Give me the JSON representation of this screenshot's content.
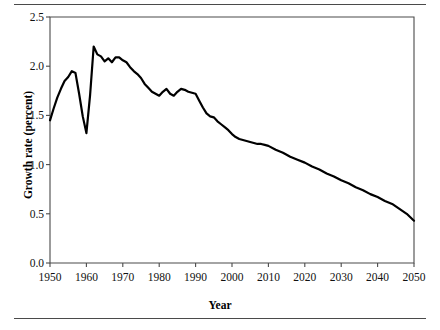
{
  "chart_data": {
    "type": "line",
    "title": "",
    "xlabel": "Year",
    "ylabel": "Growth rate (percent)",
    "xlim": [
      1950,
      2050
    ],
    "ylim": [
      0.0,
      2.5
    ],
    "xticks": [
      1950,
      1960,
      1970,
      1980,
      1990,
      2000,
      2010,
      2020,
      2030,
      2040,
      2050
    ],
    "xtick_labels": [
      "1950",
      "1960",
      "1970",
      "1980",
      "1990",
      "2000",
      "2010",
      "2020",
      "2030",
      "2040",
      "2050"
    ],
    "yticks": [
      0.0,
      0.5,
      1.0,
      1.5,
      2.0,
      2.5
    ],
    "ytick_labels": [
      "0.0",
      "0.5",
      "1.0",
      "1.5",
      "2.0",
      "2.5"
    ],
    "grid": false,
    "legend": false,
    "line_color": "#000000",
    "line_width": 2.2,
    "series": [
      {
        "name": "World population growth rate",
        "x": [
          1950,
          1951,
          1952,
          1953,
          1954,
          1955,
          1956,
          1957,
          1958,
          1959,
          1960,
          1961,
          1962,
          1963,
          1964,
          1965,
          1966,
          1967,
          1968,
          1969,
          1970,
          1971,
          1972,
          1973,
          1974,
          1975,
          1976,
          1977,
          1978,
          1979,
          1980,
          1981,
          1982,
          1983,
          1984,
          1985,
          1986,
          1987,
          1988,
          1989,
          1990,
          1991,
          1992,
          1993,
          1994,
          1995,
          1996,
          1997,
          1998,
          1999,
          2000,
          2001,
          2002,
          2003,
          2004,
          2005,
          2006,
          2007,
          2008,
          2009,
          2010,
          2012,
          2014,
          2016,
          2018,
          2020,
          2022,
          2024,
          2026,
          2028,
          2030,
          2032,
          2034,
          2036,
          2038,
          2040,
          2042,
          2044,
          2046,
          2048,
          2050
        ],
        "y": [
          1.45,
          1.57,
          1.68,
          1.77,
          1.85,
          1.89,
          1.95,
          1.93,
          1.72,
          1.49,
          1.32,
          1.7,
          2.2,
          2.12,
          2.1,
          2.05,
          2.08,
          2.04,
          2.09,
          2.09,
          2.06,
          2.04,
          1.99,
          1.95,
          1.92,
          1.88,
          1.82,
          1.78,
          1.74,
          1.72,
          1.7,
          1.74,
          1.77,
          1.72,
          1.7,
          1.74,
          1.77,
          1.76,
          1.74,
          1.73,
          1.72,
          1.65,
          1.58,
          1.52,
          1.49,
          1.48,
          1.44,
          1.41,
          1.38,
          1.35,
          1.31,
          1.28,
          1.26,
          1.25,
          1.24,
          1.23,
          1.22,
          1.21,
          1.21,
          1.2,
          1.19,
          1.15,
          1.12,
          1.08,
          1.05,
          1.02,
          0.98,
          0.95,
          0.91,
          0.88,
          0.84,
          0.81,
          0.77,
          0.74,
          0.7,
          0.67,
          0.63,
          0.6,
          0.55,
          0.5,
          0.43
        ]
      }
    ],
    "annotations": []
  }
}
